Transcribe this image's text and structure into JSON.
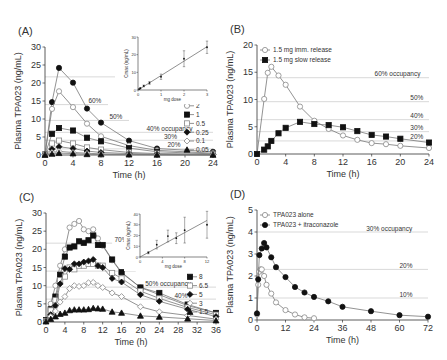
{
  "chart_data": [
    {
      "panel_label": "(A)",
      "type": "line",
      "xlabel": "Time (h)",
      "ylabel": "Plasma TPA023 (ng/mL)",
      "xlim": [
        0,
        24
      ],
      "ylim": [
        0,
        30
      ],
      "xticks": [
        0,
        4,
        8,
        12,
        16,
        20,
        24
      ],
      "yticks": [
        0,
        5,
        10,
        15,
        20,
        25,
        30
      ],
      "frame": {
        "x0": 45,
        "x1": 213,
        "y0": 155,
        "y1": 47
      },
      "reference_lines": [
        {
          "y": 21.7,
          "label": "70%",
          "label_x": 13.5,
          "x_from": 0,
          "x_to": 10
        },
        {
          "y": 14.0,
          "label": "60%",
          "label_x": 6.2,
          "x_from": 0,
          "x_to": 9
        },
        {
          "y": 9.6,
          "label": "50%",
          "label_x": 9.2,
          "x_from": 0,
          "x_to": 12
        },
        {
          "y": 6.3,
          "label": "40% occupancy",
          "label_x": 14.5,
          "x_from": 0,
          "x_to": 24
        },
        {
          "y": 4.1,
          "label": "30%",
          "label_x": 17,
          "x_from": 0,
          "x_to": 24
        },
        {
          "y": 1.7,
          "label": "20%",
          "label_x": 17.5,
          "x_from": 0,
          "x_to": 24
        }
      ],
      "series": [
        {
          "name": "3 mg",
          "marker": "circle-filled",
          "x": [
            0,
            1,
            2,
            4,
            6,
            8,
            12,
            16,
            24
          ],
          "y": [
            0.2,
            14.7,
            24.2,
            20.1,
            12.9,
            9.0,
            4.0,
            1.8,
            0.9
          ]
        },
        {
          "name": "2",
          "marker": "circle-open",
          "x": [
            0,
            1,
            2,
            4,
            6,
            8,
            12,
            16,
            24
          ],
          "y": [
            0.2,
            12.8,
            17.7,
            13.3,
            8.7,
            5.2,
            2.6,
            1.3,
            0.5
          ]
        },
        {
          "name": "1",
          "marker": "square-filled",
          "x": [
            0,
            1,
            2,
            4,
            6,
            8,
            12,
            16,
            24
          ],
          "y": [
            0.1,
            5.9,
            7.5,
            6.8,
            4.8,
            3.8,
            1.9,
            0.9,
            0.3
          ]
        },
        {
          "name": "0.5",
          "marker": "square-open",
          "x": [
            0,
            1,
            2,
            4,
            6,
            8,
            12,
            16,
            24
          ],
          "y": [
            0.1,
            3.2,
            4.0,
            3.2,
            2.1,
            1.5,
            0.7,
            0.4,
            0.2
          ]
        },
        {
          "name": "0.25",
          "marker": "diamond-filled",
          "x": [
            0,
            1,
            2,
            4,
            6,
            8,
            12,
            16,
            24
          ],
          "y": [
            0.1,
            1.6,
            2.3,
            1.8,
            1.1,
            0.7,
            0.4,
            0.2,
            0.1
          ]
        },
        {
          "name": "0.1",
          "marker": "diamond-open",
          "x": [
            0,
            1,
            2,
            4,
            6,
            8,
            12,
            16,
            24
          ],
          "y": [
            0.05,
            0.7,
            1.0,
            0.7,
            0.5,
            0.3,
            0.2,
            0.1,
            0.05
          ]
        },
        {
          "name": "0.05",
          "marker": "triangle-filled",
          "x": [
            0,
            1,
            2,
            4,
            6,
            8,
            12,
            16,
            24
          ],
          "y": [
            0.02,
            0.3,
            0.5,
            0.4,
            0.2,
            0.15,
            0.1,
            0.05,
            0.02
          ]
        }
      ],
      "legend": {
        "position": "right-inside",
        "entries": [
          "3 mg",
          "2",
          "1",
          "0.5",
          "0.25",
          "0.1",
          "0.05"
        ]
      },
      "inset": {
        "type": "scatter",
        "xlabel": "mg dose",
        "ylabel": "Cmax (ng/mL)",
        "xlim": [
          0,
          3
        ],
        "ylim": [
          0,
          30
        ],
        "xticks": [
          0,
          1,
          2,
          3
        ],
        "yticks": [
          0,
          10,
          20,
          30
        ],
        "frame": {
          "x0": 138,
          "x1": 207,
          "y0": 90,
          "y1": 37
        },
        "points": [
          {
            "x": 0.05,
            "y": 0.5,
            "err": 0.2
          },
          {
            "x": 0.1,
            "y": 1.0,
            "err": 0.3
          },
          {
            "x": 0.25,
            "y": 2.3,
            "err": 0.5
          },
          {
            "x": 0.5,
            "y": 4.0,
            "err": 0.8
          },
          {
            "x": 1,
            "y": 7.5,
            "err": 1.5
          },
          {
            "x": 2,
            "y": 17.7,
            "err": 4.5
          },
          {
            "x": 3,
            "y": 24.2,
            "err": 3.5
          }
        ],
        "fit_line": [
          [
            0,
            0
          ],
          [
            3,
            24.5
          ]
        ]
      }
    },
    {
      "panel_label": "(B)",
      "type": "line",
      "xlabel": "Time (h)",
      "ylabel": "Plasma TPA023 (ng/mL)",
      "xlim": [
        0,
        24
      ],
      "ylim": [
        0,
        20
      ],
      "xticks": [
        0,
        4,
        8,
        12,
        16,
        20,
        24
      ],
      "yticks": [
        0,
        5,
        10,
        15,
        20
      ],
      "frame": {
        "x0": 257,
        "x1": 429,
        "y0": 154,
        "y1": 45
      },
      "reference_lines": [
        {
          "y": 14.0,
          "label": "60% occupancy",
          "label_x": 16.4,
          "x_from": 0,
          "x_to": 24
        },
        {
          "y": 9.6,
          "label": "50%",
          "label_x": 21.4,
          "x_from": 0,
          "x_to": 24
        },
        {
          "y": 6.3,
          "label": "40%",
          "label_x": 21.4,
          "x_from": 0,
          "x_to": 24
        },
        {
          "y": 4.1,
          "label": "30%",
          "label_x": 21.4,
          "x_from": 0,
          "x_to": 24
        },
        {
          "y": 2.4,
          "label": "20%",
          "label_x": 21.4,
          "x_from": 0,
          "x_to": 24
        }
      ],
      "series": [
        {
          "name": "1.5 mg imm. release",
          "marker": "circle-open",
          "x": [
            0,
            1,
            1.5,
            2,
            3,
            4,
            6,
            8,
            10,
            12,
            14,
            16,
            18,
            20,
            24
          ],
          "y": [
            0,
            10.1,
            14.9,
            16.0,
            14.4,
            12.7,
            8.7,
            6.1,
            4.6,
            3.4,
            2.6,
            2.0,
            1.8,
            1.5,
            1.1
          ]
        },
        {
          "name": "1.5 mg slow release",
          "marker": "square-filled",
          "x": [
            0,
            1,
            1.5,
            2,
            3,
            4,
            6,
            8,
            10,
            12,
            14,
            16,
            18,
            20,
            24
          ],
          "y": [
            0,
            0.8,
            1.4,
            2.4,
            3.8,
            4.8,
            5.9,
            5.5,
            5.3,
            4.9,
            4.2,
            3.5,
            3.2,
            2.8,
            2.1
          ]
        }
      ],
      "legend": {
        "position": "upper-left",
        "entries": [
          "1.5 mg imm. release",
          "1.5 mg slow release"
        ]
      }
    },
    {
      "panel_label": "(C)",
      "type": "line",
      "xlabel": "Time (h)",
      "ylabel": "Plasma TPA023 (ng/mL)",
      "xlim": [
        0,
        36
      ],
      "ylim": [
        0,
        30
      ],
      "xticks": [
        0,
        4,
        8,
        12,
        16,
        20,
        24,
        28,
        32,
        36
      ],
      "yticks": [
        0,
        5,
        10,
        15,
        20,
        25,
        30
      ],
      "frame": {
        "x0": 46,
        "x1": 216,
        "y0": 322,
        "y1": 213
      },
      "reference_lines": [
        {
          "y": 21.7,
          "label": "70%",
          "label_x": 14.5,
          "x_from": 0,
          "x_to": 14
        },
        {
          "y": 14.0,
          "label": "60%",
          "label_x": 19.5,
          "x_from": 0,
          "x_to": 19
        },
        {
          "y": 9.6,
          "label": "50% occupancy",
          "label_x": 21,
          "x_from": 0,
          "x_to": 36
        },
        {
          "y": 6.3,
          "label": "40%",
          "label_x": 27.2,
          "x_from": 0,
          "x_to": 36
        }
      ],
      "series": [
        {
          "name": "12",
          "marker": "circle-open",
          "x": [
            0,
            1,
            2,
            3,
            4,
            5,
            6,
            7,
            8,
            9,
            10,
            11,
            12,
            14,
            16,
            20,
            24,
            30,
            36
          ],
          "y": [
            0.5,
            5,
            10,
            15.5,
            20,
            26,
            27,
            27.8,
            25.5,
            25,
            25.5,
            23,
            21,
            17,
            13.5,
            9.5,
            7.5,
            4.5,
            2.5
          ]
        },
        {
          "name": "8",
          "marker": "square-filled",
          "x": [
            0,
            1,
            2,
            3,
            4,
            5,
            6,
            7,
            8,
            9,
            10,
            11,
            12,
            14,
            16,
            20,
            24,
            30,
            36
          ],
          "y": [
            0.5,
            3.5,
            7,
            13,
            18,
            20.5,
            20.8,
            22.2,
            21.8,
            22.5,
            23.8,
            21.2,
            21.2,
            17.2,
            13.7,
            9.5,
            8,
            4.8,
            2.5
          ]
        },
        {
          "name": "6.5",
          "marker": "square-open",
          "x": [
            0,
            1,
            2,
            3,
            4,
            5,
            6,
            7,
            8,
            9,
            10,
            11,
            12,
            14,
            16,
            20,
            24,
            30,
            36
          ],
          "y": [
            0.3,
            3.2,
            6,
            11.5,
            12.5,
            15,
            14.5,
            15.5,
            15.5,
            16,
            16,
            15.5,
            15.5,
            13.5,
            12,
            8.5,
            6.5,
            4,
            2
          ]
        },
        {
          "name": "5",
          "marker": "diamond-filled",
          "x": [
            0,
            1,
            2,
            3,
            4,
            5,
            6,
            7,
            8,
            9,
            10,
            11,
            12,
            14,
            16,
            20,
            24,
            30,
            36
          ],
          "y": [
            0.3,
            2,
            4.5,
            10.5,
            14.7,
            14.5,
            16,
            16,
            16.5,
            16.8,
            17.2,
            15.5,
            15,
            12,
            11,
            7.5,
            5.7,
            3.5,
            1.5
          ]
        },
        {
          "name": "3",
          "marker": "diamond-open",
          "x": [
            0,
            1,
            2,
            3,
            4,
            5,
            6,
            7,
            8,
            9,
            10,
            11,
            12,
            14,
            16,
            20,
            24,
            30,
            36
          ],
          "y": [
            0.2,
            1.5,
            3,
            5.5,
            7,
            9.2,
            10,
            9.8,
            10,
            10.8,
            10.9,
            10,
            9.5,
            8,
            7,
            4.2,
            2.8,
            1.8,
            0.8
          ]
        },
        {
          "name": "1.5",
          "marker": "triangle-filled",
          "x": [
            0,
            1,
            2,
            3,
            4,
            5,
            6,
            7,
            8,
            9,
            10,
            11,
            12,
            14,
            16,
            20,
            24,
            30,
            36
          ],
          "y": [
            0.1,
            0.8,
            1.5,
            2.2,
            2.5,
            3.2,
            3.4,
            3.4,
            3.4,
            3.5,
            3.8,
            3.7,
            3.6,
            2.8,
            2.5,
            1.7,
            1.4,
            0.9,
            0.4
          ]
        }
      ],
      "legend": {
        "position": "right-inside",
        "entries": [
          "12",
          "8",
          "6.5",
          "5",
          "3",
          "1.5"
        ]
      },
      "inset": {
        "type": "scatter",
        "xlabel": "mg dose",
        "ylabel": "Cmax (ng/mL)",
        "xlim": [
          0,
          12
        ],
        "ylim": [
          0,
          40
        ],
        "xticks": [
          0,
          4,
          8,
          12
        ],
        "yticks": [
          0,
          10,
          20,
          30,
          40
        ],
        "frame": {
          "x0": 140,
          "x1": 207,
          "y0": 257,
          "y1": 214
        },
        "points": [
          {
            "x": 1.5,
            "y": 4.0,
            "err": 1.0
          },
          {
            "x": 3,
            "y": 11.5,
            "err": 4.0
          },
          {
            "x": 5,
            "y": 19.5,
            "err": 5.5
          },
          {
            "x": 6.5,
            "y": 17.5,
            "err": 5.0
          },
          {
            "x": 8,
            "y": 25.0,
            "err": 12.0
          },
          {
            "x": 12,
            "y": 30.0,
            "err": 12.5
          }
        ],
        "fit_line": [
          [
            0,
            0
          ],
          [
            12,
            34
          ]
        ]
      }
    },
    {
      "panel_label": "(D)",
      "type": "line",
      "xlabel": "Time (h)",
      "ylabel": "Plasma TPA023 (ng/mL)",
      "xlim": [
        0,
        72
      ],
      "ylim": [
        0,
        5
      ],
      "xticks": [
        0,
        12,
        24,
        36,
        48,
        60,
        72
      ],
      "yticks": [
        0,
        1,
        2,
        3,
        4,
        5
      ],
      "frame": {
        "x0": 257,
        "x1": 428,
        "y0": 320,
        "y1": 210
      },
      "reference_lines": [
        {
          "y": 4.0,
          "label": "30% occupancy",
          "label_x": 46,
          "x_from": 0,
          "x_to": 72
        },
        {
          "y": 2.3,
          "label": "20%",
          "label_x": 60,
          "x_from": 0,
          "x_to": 72
        },
        {
          "y": 1.0,
          "label": "10%",
          "label_x": 60,
          "x_from": 0,
          "x_to": 72
        }
      ],
      "series": [
        {
          "name": "TPA023 alone",
          "marker": "circle-open",
          "x": [
            0,
            0.5,
            1,
            1.5,
            2,
            3,
            4,
            6,
            8,
            12,
            16,
            20,
            24
          ],
          "y": [
            0.25,
            1.6,
            2.2,
            2.3,
            2.3,
            2.0,
            1.6,
            1.2,
            0.8,
            0.45,
            0.25,
            0.12,
            0.08
          ]
        },
        {
          "name": "TPA023 + itraconazole",
          "marker": "circle-filled",
          "x": [
            0,
            0.5,
            1,
            2,
            3,
            4,
            6,
            8,
            12,
            16,
            20,
            24,
            30,
            36,
            48,
            60,
            72
          ],
          "y": [
            0.3,
            1.85,
            2.95,
            3.25,
            3.5,
            3.3,
            2.85,
            2.4,
            1.95,
            1.5,
            1.25,
            1.05,
            0.85,
            0.6,
            0.4,
            0.22,
            0.15
          ]
        }
      ],
      "legend": {
        "position": "upper-left",
        "entries": [
          "TPA023 alone",
          "TPA023 + itraconazole"
        ]
      }
    }
  ]
}
